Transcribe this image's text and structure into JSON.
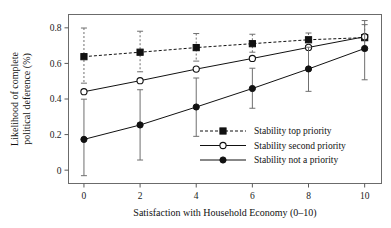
{
  "chart_data": {
    "type": "line",
    "title": "",
    "xlabel": "Satisfaction with Household Economy (0–10)",
    "ylabel": "Likelihood of complete political deference (%)",
    "ylabel_line1": "Likelihood of complete",
    "ylabel_line2": "political deference (%)",
    "x": [
      0,
      2,
      4,
      6,
      8,
      10
    ],
    "xticklabels": [
      "0",
      "2",
      "4",
      "6",
      "8",
      "10"
    ],
    "yticks": [
      0,
      0.2,
      0.4,
      0.6,
      0.8
    ],
    "yticklabels": [
      "0",
      "0.2",
      "0.4",
      "0.6",
      "0.8"
    ],
    "xlim": [
      -0.55,
      10.6
    ],
    "ylim": [
      -0.075,
      0.875
    ],
    "grid": false,
    "legend_position": "center-right-inside",
    "series": [
      {
        "name": "Stability top priority",
        "line_style": "dashed",
        "marker": "filled-square",
        "color": "#111111",
        "values": [
          0.638,
          0.663,
          0.689,
          0.711,
          0.733,
          0.745
        ],
        "err_low": [
          0.489,
          0.553,
          0.613,
          0.663,
          0.7,
          0.672
        ],
        "err_high": [
          0.799,
          0.781,
          0.768,
          0.764,
          0.771,
          0.818
        ]
      },
      {
        "name": "Stability second priority",
        "line_style": "solid",
        "marker": "open-circle",
        "color": "#111111",
        "values": [
          0.441,
          0.503,
          0.568,
          0.628,
          0.69,
          0.75
        ],
        "err_low": [
          0.441,
          0.503,
          0.568,
          0.628,
          0.69,
          0.75
        ],
        "err_high": [
          0.441,
          0.503,
          0.568,
          0.628,
          0.69,
          0.75
        ]
      },
      {
        "name": "Stability not a priority",
        "line_style": "solid",
        "marker": "filled-circle",
        "color": "#111111",
        "values": [
          0.173,
          0.254,
          0.355,
          0.459,
          0.569,
          0.684
        ],
        "err_low": [
          -0.031,
          0.057,
          0.19,
          0.348,
          0.443,
          0.508
        ],
        "err_high": [
          0.399,
          0.452,
          0.518,
          0.573,
          0.691,
          0.841
        ]
      }
    ]
  },
  "legend": {
    "items": [
      {
        "label": "Stability top priority"
      },
      {
        "label": "Stability second priority"
      },
      {
        "label": "Stability not a priority"
      }
    ]
  }
}
